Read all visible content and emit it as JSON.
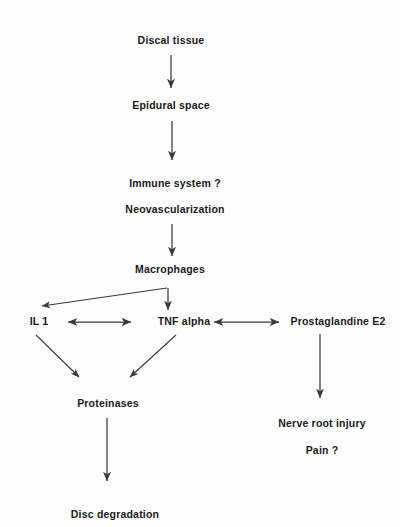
{
  "figure": {
    "kind": "flowchart",
    "orientation": "top-to-bottom",
    "background_color": "#fdfdfd",
    "text_color": "#1a1a1a",
    "edge_color": "#3a3a3a"
  },
  "nodes": [
    {
      "id": "discal_tissue",
      "label": "Discal tissue",
      "x": 171,
      "y": 41
    },
    {
      "id": "epidural_space",
      "label": "Epidural space",
      "x": 171,
      "y": 106
    },
    {
      "id": "immune_system",
      "label": "Immune system ?",
      "x": 175,
      "y": 184
    },
    {
      "id": "neovascularization",
      "label": "Neovascularization",
      "x": 175,
      "y": 210
    },
    {
      "id": "macrophages",
      "label": "Macrophages",
      "x": 170,
      "y": 270
    },
    {
      "id": "il1",
      "label": "IL 1",
      "x": 39,
      "y": 322
    },
    {
      "id": "tnf_alpha",
      "label": "TNF alpha",
      "x": 184,
      "y": 322
    },
    {
      "id": "prostaglandine_e2",
      "label": "Prostaglandine E2",
      "x": 338,
      "y": 322
    },
    {
      "id": "proteinases",
      "label": "Proteinases",
      "x": 108,
      "y": 404
    },
    {
      "id": "nerve_root_injury",
      "label": "Nerve root injury",
      "x": 322,
      "y": 424
    },
    {
      "id": "pain",
      "label": "Pain ?",
      "x": 322,
      "y": 451
    },
    {
      "id": "disc_degradation",
      "label": "Disc degradation",
      "x": 115,
      "y": 515
    }
  ],
  "edges": [
    {
      "id": "discal-to-epidural",
      "from": "discal_tissue",
      "to": "epidural_space",
      "style": "arrow",
      "direction": "down"
    },
    {
      "id": "epidural-to-immune",
      "from": "epidural_space",
      "to": "immune_system",
      "style": "arrow",
      "direction": "down"
    },
    {
      "id": "neovasc-to-macrophages",
      "from": "neovascularization",
      "to": "macrophages",
      "style": "arrow",
      "direction": "down"
    },
    {
      "id": "macrophages-to-il1",
      "from": "macrophages",
      "to": "il1",
      "style": "arrow",
      "direction": "diagonal-left"
    },
    {
      "id": "macrophages-to-tnf",
      "from": "macrophages",
      "to": "tnf_alpha",
      "style": "arrow",
      "direction": "down"
    },
    {
      "id": "il1-tnf",
      "from": "il1",
      "to": "tnf_alpha",
      "style": "double-arrow",
      "direction": "horizontal"
    },
    {
      "id": "tnf-prostaglandine",
      "from": "tnf_alpha",
      "to": "prostaglandine_e2",
      "style": "double-arrow",
      "direction": "horizontal"
    },
    {
      "id": "il1-to-proteinases",
      "from": "il1",
      "to": "proteinases",
      "style": "arrow",
      "direction": "diagonal-right"
    },
    {
      "id": "tnf-to-proteinases",
      "from": "tnf_alpha",
      "to": "proteinases",
      "style": "arrow",
      "direction": "diagonal-left"
    },
    {
      "id": "prostaglandine-to-nerve",
      "from": "prostaglandine_e2",
      "to": "nerve_root_injury",
      "style": "arrow",
      "direction": "down"
    },
    {
      "id": "proteinases-to-disc",
      "from": "proteinases",
      "to": "disc_degradation",
      "style": "arrow",
      "direction": "down"
    }
  ]
}
